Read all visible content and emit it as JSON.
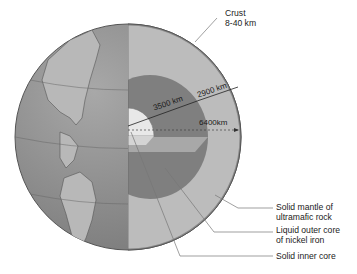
{
  "diagram": {
    "labels": {
      "crust_line1": "Crust",
      "crust_line2": "8-40 km",
      "mantle_line1": "Solid mantle of",
      "mantle_line2": "ultramafic rock",
      "outer_core_line1": "Liquid outer core",
      "outer_core_line2": "of nickel iron",
      "inner_core": "Solid inner core"
    },
    "dimensions": {
      "core_radius": "3500 km",
      "mantle_thickness": "2900 km",
      "earth_radius": "6400km"
    },
    "colors": {
      "ocean": "#8e8e8e",
      "land": "#b4b4b4",
      "crust": "#9c9c9c",
      "mantle": "#b9b9b9",
      "outer_core": "#7d7d7d",
      "outer_core_top": "#a5a5a5",
      "inner_core": "#e6e6e6",
      "leader_line": "#555555"
    }
  }
}
